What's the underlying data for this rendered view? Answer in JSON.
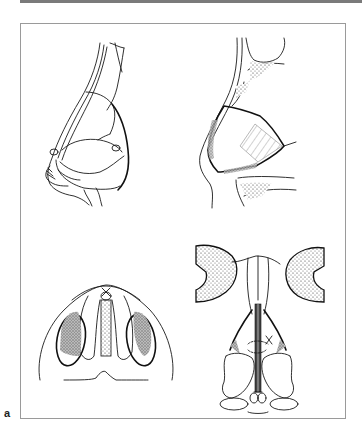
{
  "figure": {
    "panel_label": "a",
    "layout": "2x2 grid of line drawings inside a bordered frame",
    "panels": [
      {
        "position": "top-left",
        "subject": "lateral view of nose showing cartilaginous framework"
      },
      {
        "position": "top-right",
        "subject": "lateral view of nose with hatched graft region"
      },
      {
        "position": "bottom-left",
        "subject": "basal view of nose with shaded nostrils and columellar strut"
      },
      {
        "position": "bottom-right",
        "subject": "frontal view of nasal framework with midline graft and sutures"
      }
    ]
  },
  "colors": {
    "line": "#1a1a1a",
    "frame": "#9a9a9a",
    "top_rule": "#7a7a7a",
    "shading": "#8a8a8a"
  }
}
